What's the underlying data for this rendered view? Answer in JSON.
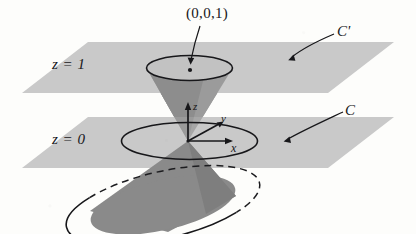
{
  "figure": {
    "background_color": "#fdfdfb",
    "plane_fill": "#c9c9c9",
    "cone_fill_dark": "#8a8a8a",
    "cone_fill_mid": "#9a9a9a",
    "stroke_color": "#17171a"
  },
  "labels": {
    "point": "(0,0,1)",
    "curve_upper": "C'",
    "curve_lower": "C",
    "plane_upper": "z = 1",
    "plane_lower": "z = 0"
  },
  "axes": {
    "z": "z",
    "y": "y",
    "x": "x"
  },
  "elements": {
    "plane_upper_name": "plane-z-equals-1",
    "plane_lower_name": "plane-z-equals-0",
    "upper_cone": "upper-nappe",
    "lower_cone": "lower-nappe",
    "ellipse_upper": "circle-C-prime",
    "ellipse_lower": "circle-C",
    "apex_point": "origin-apex",
    "marked_point": "point-0-0-1"
  }
}
